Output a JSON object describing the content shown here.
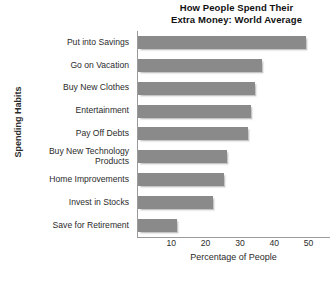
{
  "chart_data": {
    "type": "bar",
    "orientation": "horizontal",
    "title": "How People Spend Their Extra Money: World Average",
    "title_lines": [
      "How People Spend Their",
      "Extra Money: World Average"
    ],
    "xlabel": "Percentage of People",
    "ylabel": "Spending Habits",
    "categories": [
      "Put into Savings",
      "Go on Vacation",
      "Buy New Clothes",
      "Entertainment",
      "Pay Off Debts",
      "Buy New Technology Products",
      "Home Improvements",
      "Invest in Stocks",
      "Save for Retirement"
    ],
    "category_lines": [
      [
        "Put into Savings"
      ],
      [
        "Go on Vacation"
      ],
      [
        "Buy New Clothes"
      ],
      [
        "Entertainment"
      ],
      [
        "Pay Off Debts"
      ],
      [
        "Buy New Technology",
        "Products"
      ],
      [
        "Home Improvements"
      ],
      [
        "Invest in Stocks"
      ],
      [
        "Save for Retirement"
      ]
    ],
    "values": [
      49,
      36,
      34,
      33,
      32,
      26,
      25,
      22,
      11.5
    ],
    "xlim": [
      0,
      58
    ],
    "xticks": [
      10,
      20,
      30,
      40,
      50
    ],
    "grid": false,
    "legend": false,
    "bar_color": "#8a8a8a",
    "axis_color": "#9a9a9a",
    "text_color": "#2b2b2b"
  }
}
